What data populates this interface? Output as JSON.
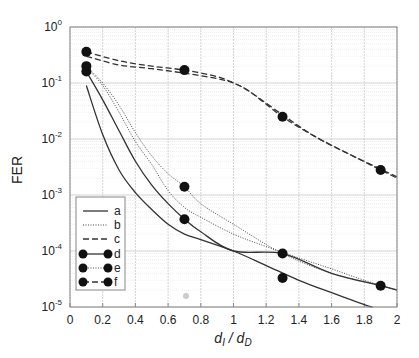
{
  "chart_data": {
    "type": "line",
    "title": "",
    "xlabel": "d_I / d_D",
    "ylabel": "FER",
    "xscale": "linear",
    "yscale": "log",
    "xlim": [
      0,
      2
    ],
    "ylim": [
      1e-05,
      1
    ],
    "grid": true,
    "x_ticks": [
      0,
      0.2,
      0.4,
      0.6,
      0.8,
      1,
      1.2,
      1.4,
      1.6,
      1.8,
      2
    ],
    "x_tick_labels": [
      "0",
      "0.2",
      "0.4",
      "0.6",
      "0.8",
      "1",
      "1.2",
      "1.4",
      "1.6",
      "1.8",
      "2"
    ],
    "y_ticks": [
      1e-05,
      0.0001,
      0.001,
      0.01,
      0.1,
      1
    ],
    "y_tick_labels": [
      {
        "base": "10",
        "exp": "-5"
      },
      {
        "base": "10",
        "exp": "-4"
      },
      {
        "base": "10",
        "exp": "-3"
      },
      {
        "base": "10",
        "exp": "-2"
      },
      {
        "base": "10",
        "exp": "-1"
      },
      {
        "base": "10",
        "exp": "0"
      }
    ],
    "legend_position": "lower left",
    "series": [
      {
        "name": "a",
        "style": "solid",
        "markers": false,
        "x": [
          0.1,
          0.2,
          0.3,
          0.4,
          0.5,
          0.6,
          0.7,
          0.8,
          1.0,
          1.2,
          1.4,
          1.6,
          1.8,
          1.85
        ],
        "y": [
          0.09,
          0.012,
          0.0028,
          0.0011,
          0.00055,
          0.0003,
          0.0002,
          0.00016,
          0.0001,
          5.5e-05,
          3e-05,
          1.8e-05,
          1.1e-05,
          1e-05
        ]
      },
      {
        "name": "b",
        "style": "dotted",
        "markers": false,
        "x": [
          0.1,
          0.2,
          0.3,
          0.4,
          0.5,
          0.6,
          0.7,
          0.8,
          1.0,
          1.2,
          1.4,
          1.6,
          1.8,
          2.0
        ],
        "y": [
          0.19,
          0.09,
          0.03,
          0.009,
          0.0035,
          0.0012,
          0.0006,
          0.0004,
          0.0002,
          0.00012,
          7.5e-05,
          4.8e-05,
          3e-05,
          2e-05
        ]
      },
      {
        "name": "c",
        "style": "dashed",
        "markers": false,
        "x": [
          0.1,
          0.3,
          0.5,
          0.7,
          0.9,
          1.0,
          1.1,
          1.3,
          1.5,
          1.7,
          1.9,
          2.0
        ],
        "y": [
          0.3,
          0.21,
          0.18,
          0.15,
          0.12,
          0.1,
          0.07,
          0.027,
          0.011,
          0.0055,
          0.0029,
          0.0021
        ]
      },
      {
        "name": "d",
        "style": "solid",
        "markers": true,
        "x": [
          0.1,
          0.2,
          0.3,
          0.4,
          0.5,
          0.6,
          0.7,
          0.8,
          1.0,
          1.3,
          1.6,
          1.9,
          2.0
        ],
        "y": [
          0.16,
          0.05,
          0.014,
          0.004,
          0.0015,
          0.0007,
          0.00037,
          0.00022,
          0.0001,
          9e-05,
          4e-05,
          2.4e-05,
          2e-05
        ]
      },
      {
        "name": "e",
        "style": "dotted",
        "markers": true,
        "x": [
          0.1,
          0.2,
          0.3,
          0.4,
          0.5,
          0.6,
          0.7,
          0.8,
          1.0,
          1.3,
          1.6,
          1.9,
          2.0
        ],
        "y": [
          0.2,
          0.1,
          0.04,
          0.013,
          0.005,
          0.0024,
          0.0014,
          0.0007,
          0.0003,
          9e-05,
          4e-05,
          2.4e-05,
          2e-05
        ]
      },
      {
        "name": "f",
        "style": "dashed",
        "markers": true,
        "x": [
          0.1,
          0.3,
          0.5,
          0.7,
          0.9,
          1.0,
          1.1,
          1.3,
          1.5,
          1.7,
          1.9,
          2.0
        ],
        "y": [
          0.36,
          0.25,
          0.2,
          0.17,
          0.13,
          0.1,
          0.07,
          0.025,
          0.011,
          0.0055,
          0.0028,
          0.002
        ]
      }
    ],
    "marker_points": {
      "d": [
        [
          0.1,
          0.16
        ],
        [
          0.7,
          0.00037
        ],
        [
          1.3,
          3.3e-05
        ]
      ],
      "e": [
        [
          0.1,
          0.2
        ],
        [
          0.7,
          0.0014
        ]
      ],
      "f": [
        [
          0.1,
          0.36
        ],
        [
          0.7,
          0.17
        ],
        [
          1.3,
          0.025
        ],
        [
          1.9,
          0.0028
        ]
      ],
      "upper_solid": [
        [
          1.3,
          9e-05
        ],
        [
          1.9,
          2.4e-05
        ]
      ]
    }
  },
  "axes": {
    "ylabel": "FER",
    "xlabel_main": "d",
    "xlabel_sub1": "I",
    "xlabel_sep": " / d",
    "xlabel_sub2": "D"
  },
  "legend": {
    "items": [
      {
        "label": "a"
      },
      {
        "label": "b"
      },
      {
        "label": "c"
      },
      {
        "label": "d"
      },
      {
        "label": "e"
      },
      {
        "label": "f"
      }
    ]
  },
  "colors": {
    "line": "#333333",
    "grid": "#c8c8c8",
    "grid_minor": "#e0e0e0",
    "marker": "#111111",
    "frame": "#888888"
  }
}
